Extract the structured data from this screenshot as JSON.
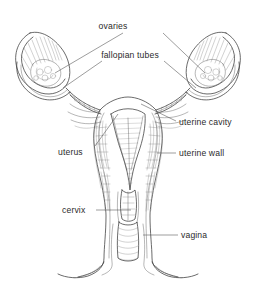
{
  "figure": {
    "kind": "anatomical-line-drawing",
    "style": "pen-and-ink hatched medical illustration, grayscale",
    "background_color": "#ffffff",
    "ink_color": "#3a3a3a",
    "label_color": "#2b2b2b",
    "leader_color": "#5a5a5a",
    "width": 256,
    "height": 294
  },
  "labels": {
    "ovaries": "ovaries",
    "fallopian_tubes": "fallopian tubes",
    "uterine_cavity": "uterine cavity",
    "uterus": "uterus",
    "uterine_wall": "uterine wall",
    "cervix": "cervix",
    "vagina": "vagina"
  },
  "structures": [
    {
      "name": "ovaries",
      "label": "ovaries",
      "side": "both",
      "description": "paired almond-shaped organs at the outer ends, drawn with radiating fimbrial hatching"
    },
    {
      "name": "fallopian-tubes",
      "label": "fallopian tubes",
      "side": "both",
      "description": "curved tubes sweeping from each ovary inward to the upper uterus"
    },
    {
      "name": "uterine-cavity",
      "label": "uterine cavity",
      "side": "center",
      "description": "inverted triangular cut-away space inside the uterus with stippled endometrial lining"
    },
    {
      "name": "uterus",
      "label": "uterus",
      "side": "center",
      "description": "pear-shaped muscular body, shown in coronal section"
    },
    {
      "name": "uterine-wall",
      "label": "uterine wall",
      "side": "right",
      "description": "thick myometrial wall drawn with dense vertical hatching"
    },
    {
      "name": "cervix",
      "label": "cervix",
      "side": "left",
      "description": "narrow neck joining the uterus to the vagina"
    },
    {
      "name": "vagina",
      "label": "vagina",
      "side": "right",
      "description": "canal below the cervix, flaring outward at the lower margin"
    }
  ]
}
